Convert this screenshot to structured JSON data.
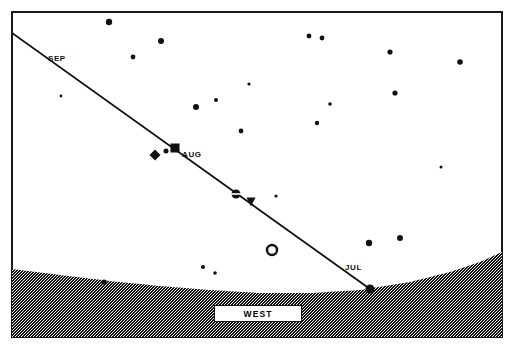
{
  "chart_data": {
    "type": "scatter",
    "subtitle": "Path of a planet along the ecliptic from July through September",
    "xlabel": "",
    "ylabel": "",
    "grid": false,
    "legend_position": "none",
    "xlim": [
      0,
      514
    ],
    "ylim": [
      0,
      352
    ],
    "frame": {
      "x": 11,
      "y": 11,
      "width": 492,
      "height": 327,
      "border_color": "#1a1a1a",
      "border_width": 2
    },
    "background_color": "#ffffff",
    "ink_color": "#111111",
    "horizon": {
      "name": "horizon-ground",
      "description": "Stippled dark ground below a shallow arc horizon line",
      "fill_color": "#1c1c1c",
      "pattern": "stipple-dither",
      "points": [
        [
          12,
          269
        ],
        [
          60,
          275
        ],
        [
          110,
          281
        ],
        [
          160,
          286
        ],
        [
          210,
          290
        ],
        [
          260,
          293
        ],
        [
          310,
          293
        ],
        [
          360,
          290
        ],
        [
          410,
          282
        ],
        [
          450,
          272
        ],
        [
          480,
          262
        ],
        [
          502,
          252
        ]
      ]
    },
    "ecliptic": {
      "name": "ecliptic-path",
      "label": "planet track",
      "color": "#111111",
      "width": 1.8,
      "start": [
        12,
        33
      ],
      "end": [
        370,
        289
      ]
    },
    "month_labels": [
      {
        "name": "sep-label",
        "text": "SEP",
        "x": 48,
        "y": 54
      },
      {
        "name": "aug-label",
        "text": "AUG",
        "x": 182,
        "y": 150
      },
      {
        "name": "jul-label",
        "text": "JUL",
        "x": 345,
        "y": 263
      }
    ],
    "direction_marker": {
      "name": "west-direction-marker",
      "text": "WEST",
      "x": 214,
      "y": 305,
      "width": 88,
      "height": 17
    },
    "planet_markers": [
      {
        "name": "marker-diamond",
        "symbol": "diamond",
        "x": 155,
        "y": 155,
        "size": 11,
        "filled": true
      },
      {
        "name": "marker-dot-small",
        "symbol": "circle",
        "x": 166,
        "y": 151,
        "size": 5,
        "filled": true
      },
      {
        "name": "marker-square",
        "symbol": "square",
        "x": 175,
        "y": 148,
        "size": 9,
        "filled": true
      },
      {
        "name": "marker-saturn",
        "symbol": "circle-with-bar",
        "x": 236,
        "y": 194,
        "size": 9,
        "filled": true
      },
      {
        "name": "marker-triangle",
        "symbol": "triangle-down",
        "x": 251,
        "y": 202,
        "size": 9,
        "filled": true
      },
      {
        "name": "marker-open-circle",
        "symbol": "circle-open",
        "x": 272,
        "y": 250,
        "size": 12,
        "filled": false
      },
      {
        "name": "marker-horizon-dot",
        "symbol": "circle",
        "x": 370,
        "y": 289,
        "size": 9,
        "filled": true
      }
    ],
    "stars": [
      {
        "x": 109,
        "y": 22,
        "r": 3.2
      },
      {
        "x": 161,
        "y": 41,
        "r": 3.0
      },
      {
        "x": 133,
        "y": 57,
        "r": 2.4
      },
      {
        "x": 196,
        "y": 107,
        "r": 3.0
      },
      {
        "x": 216,
        "y": 100,
        "r": 2.0
      },
      {
        "x": 241,
        "y": 131,
        "r": 2.4
      },
      {
        "x": 249,
        "y": 84,
        "r": 1.6
      },
      {
        "x": 309,
        "y": 36,
        "r": 2.4
      },
      {
        "x": 322,
        "y": 38,
        "r": 2.4
      },
      {
        "x": 390,
        "y": 52,
        "r": 2.6
      },
      {
        "x": 460,
        "y": 62,
        "r": 2.8
      },
      {
        "x": 395,
        "y": 93,
        "r": 2.6
      },
      {
        "x": 317,
        "y": 123,
        "r": 2.2
      },
      {
        "x": 330,
        "y": 104,
        "r": 1.8
      },
      {
        "x": 369,
        "y": 243,
        "r": 3.2
      },
      {
        "x": 400,
        "y": 238,
        "r": 3.0
      },
      {
        "x": 104,
        "y": 282,
        "r": 2.6
      },
      {
        "x": 203,
        "y": 267,
        "r": 2.0
      },
      {
        "x": 215,
        "y": 273,
        "r": 1.8
      },
      {
        "x": 276,
        "y": 196,
        "r": 1.6
      },
      {
        "x": 61,
        "y": 96,
        "r": 1.4
      },
      {
        "x": 441,
        "y": 167,
        "r": 1.5
      }
    ]
  }
}
